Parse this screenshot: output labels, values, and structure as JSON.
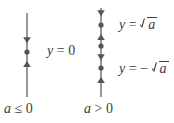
{
  "figure": {
    "type": "phase-line-diagram",
    "background_color": "#ffffff",
    "stroke_color": "#6b6b6b",
    "text_color": "#3d3d3d",
    "width": 174,
    "height": 123
  },
  "panels": [
    {
      "id": "left",
      "caption": "a ≤ 0",
      "caption_parts": {
        "variable": "a",
        "relation": "≤",
        "value": "0"
      },
      "axis": {
        "x": 27,
        "y_top": 13,
        "y_bottom": 97
      },
      "markers": [
        {
          "kind": "arrow",
          "direction": "down",
          "y": 40
        },
        {
          "kind": "dot",
          "y": 52,
          "label": "y = 0"
        },
        {
          "kind": "arrow",
          "direction": "up",
          "y": 64
        }
      ],
      "labels": [
        {
          "id": "y-equals-zero",
          "text": "y = 0",
          "lhs": "y",
          "relation": "=",
          "rhs": "0",
          "rhs_kind": "number",
          "x": 47,
          "y": 45
        }
      ]
    },
    {
      "id": "right",
      "caption": "a > 0",
      "caption_parts": {
        "variable": "a",
        "relation": ">",
        "value": "0"
      },
      "axis": {
        "x": 101,
        "y_top": 8,
        "y_bottom": 97
      },
      "markers": [
        {
          "kind": "arrow",
          "direction": "down",
          "y": 13
        },
        {
          "kind": "dot",
          "y": 25,
          "label": "y = √a"
        },
        {
          "kind": "arrow",
          "direction": "up",
          "y": 37
        },
        {
          "kind": "dot",
          "y": 46,
          "label": "y = 0"
        },
        {
          "kind": "arrow",
          "direction": "down",
          "y": 57
        },
        {
          "kind": "dot",
          "y": 68,
          "label": "y = -√a"
        },
        {
          "kind": "arrow",
          "direction": "up",
          "y": 80
        }
      ],
      "labels": [
        {
          "id": "y-equals-sqrt-a",
          "text": "y = √a",
          "lhs": "y",
          "relation": "=",
          "rhs": "√a",
          "rhs_kind": "radical",
          "sign": "",
          "radicand": "a",
          "x": 119,
          "y": 18
        },
        {
          "id": "y-equals-minus-sqrt-a",
          "text": "y = −√a",
          "lhs": "y",
          "relation": "=",
          "rhs": "−√a",
          "rhs_kind": "radical",
          "sign": "−",
          "radicand": "a",
          "x": 119,
          "y": 62
        }
      ]
    }
  ],
  "captions": {
    "left": {
      "variable": "a",
      "relation": "≤",
      "value": "0",
      "x": 4,
      "y": 102
    },
    "right": {
      "variable": "a",
      "relation": ">",
      "value": "0",
      "x": 84,
      "y": 102
    }
  }
}
